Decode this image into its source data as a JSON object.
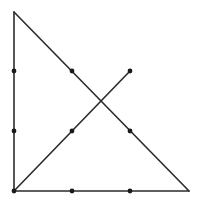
{
  "diagram": {
    "title": "",
    "colors": {
      "line": "#2b2b2b",
      "dot": "#1a1a1a",
      "background": "#ffffff"
    },
    "dots": [
      {
        "x": 14,
        "y": 71
      },
      {
        "x": 72,
        "y": 71
      },
      {
        "x": 130,
        "y": 71
      },
      {
        "x": 14,
        "y": 131
      },
      {
        "x": 72,
        "y": 131
      },
      {
        "x": 130,
        "y": 131
      },
      {
        "x": 14,
        "y": 191
      },
      {
        "x": 72,
        "y": 191
      },
      {
        "x": 130,
        "y": 191
      }
    ],
    "path": [
      {
        "x": 130,
        "y": 71
      },
      {
        "x": 14,
        "y": 191
      },
      {
        "x": 14,
        "y": 12
      },
      {
        "x": 189,
        "y": 191
      },
      {
        "x": 14,
        "y": 191
      }
    ]
  }
}
